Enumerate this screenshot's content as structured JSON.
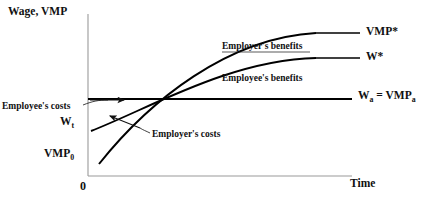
{
  "figure": {
    "kind": "economic-diagram"
  },
  "axes": {
    "y_title": "Wage, VMP",
    "x_title": "Time",
    "origin_label": "0",
    "x_axis_y": 176,
    "y_axis_x": 88,
    "x_axis_x_start": 88,
    "x_axis_x_end": 352,
    "y_axis_y_top": 14,
    "y_axis_y_bottom": 176
  },
  "curves": [
    {
      "name": "vmp-curve",
      "label": "VMP*",
      "label_x": 366,
      "label_y": 27,
      "leader_x1": 316,
      "leader_x2": 360,
      "leader_y": 33,
      "start": {
        "x": 99,
        "y": 164
      },
      "end": {
        "x": 316,
        "y": 33
      },
      "control1": {
        "x": 150,
        "y": 100
      },
      "control2": {
        "x": 228,
        "y": 38
      }
    },
    {
      "name": "wage-curve",
      "label": "W*",
      "label_x": 366,
      "label_y": 52,
      "leader_x1": 316,
      "leader_x2": 360,
      "leader_y": 58,
      "start": {
        "x": 91,
        "y": 131
      },
      "end": {
        "x": 316,
        "y": 58
      },
      "control1": {
        "x": 150,
        "y": 108
      },
      "control2": {
        "x": 230,
        "y": 60
      }
    }
  ],
  "reference_line": {
    "name": "alternative-wage-line",
    "label": "Wₐ = VMPₐ",
    "label_main_1": "W",
    "label_sub_1": "a",
    "label_eq": " = VMP",
    "label_sub_2": "a",
    "label_x": 358,
    "label_y": 89,
    "y": 99,
    "x_start": 88,
    "x_end": 352
  },
  "point_labels": [
    {
      "name": "wt-label",
      "main": "W",
      "sub": "t",
      "x": 60,
      "y": 118
    },
    {
      "name": "vmp0-label",
      "main": "VMP",
      "sub": "0",
      "x": 44,
      "y": 150
    }
  ],
  "annotations": [
    {
      "name": "employers-benefits-label",
      "text": "Employer's benefits",
      "x": 222,
      "y": 44
    },
    {
      "name": "employees-benefits-label",
      "text": "Employee's benefits",
      "x": 222,
      "y": 76
    },
    {
      "name": "employees-costs-label",
      "text": "Employee's costs",
      "x": 2,
      "y": 104
    },
    {
      "name": "employers-costs-label",
      "text": "Employer's costs",
      "x": 98,
      "y": 133
    }
  ],
  "colors": {
    "ink": "#111111",
    "curve": "#000000",
    "axis": "#9a9a9a",
    "background": "#ffffff"
  }
}
